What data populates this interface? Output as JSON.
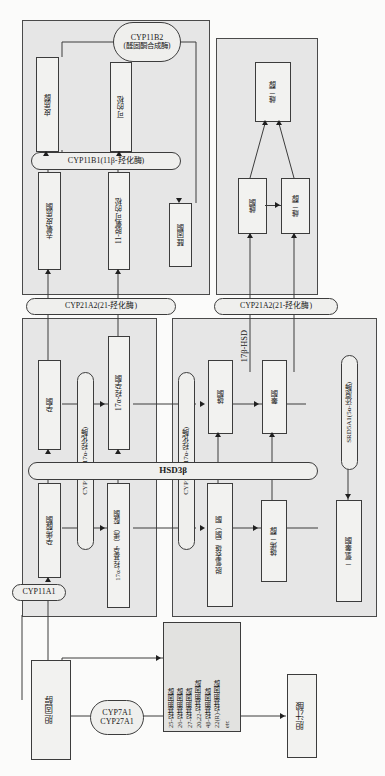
{
  "diagram": {
    "orientation": "rotated-90"
  },
  "groups": {
    "corticoid_panel": "corticoid-pathway-panel",
    "estrogen_panel": "estrogen-pathway-panel",
    "progestogen_panel": "progestogen-pathway-panel",
    "androgen_panel": "androgen-pathway-panel"
  },
  "metabolites": {
    "cortisol": "皮质醇",
    "cortisone": "可的松",
    "deoxycorticosterone": "去氧皮质酮",
    "deoxycortisol_11": "11-脱氧可的松",
    "aldosterone": "醛固酮",
    "estradiol": "雌二醇",
    "estrone": "雌酮",
    "estradiol_2": "雌二醇",
    "progesterone": "孕酮",
    "hydroxyprogesterone_17a": "17α-羟孕酮",
    "pregnenolone": "孕烯醇酮",
    "hydroxypregnenolone_17a": "17α-羟基孕（烯）醇酮",
    "androstenedione": "雄酮",
    "testosterone": "睾酮",
    "dhea": "脱氢表雄（酮）酮",
    "androstenediol": "雄烯二醇",
    "dihydrotestosterone": "二氢睾酮",
    "cholesterol": "胆固醇",
    "bile_acid": "胆汁酸"
  },
  "enzymes": {
    "cyp11b2": "CYP11B2\n(醛固酮合成酶)",
    "cyp11b2_line1": "CYP11B2",
    "cyp11b2_line2": "(醛固酮合成酶)",
    "cyp11b1": "CYP11B1(11β-羟化酶)",
    "cyp21a2_left": "CYP21A2(21-羟化酶)",
    "cyp21a2_right": "CYP21A2(21-羟化酶)",
    "cyp17a1_left": "CYP17A1(17α-羟化酶)",
    "cyp17a1_right": "CYP17A1(17α-羟化酶)",
    "hsd3b": "HSD3β",
    "hsd17b": "17β-HSD",
    "srd5a1": "SRD5A1(5α-还原酶)",
    "cyp11a1": "CYP11A1",
    "cyp7a1": "CYP7A1",
    "cyp27a1": "CYP27A1"
  },
  "oxysterols": {
    "lines": [
      "25-羟基胆固醇,",
      "26-羟基胆固醇,",
      "27-羟基胆固醇,",
      "20,22-羟基胆固醇,",
      "4β-羟基胆固醇,",
      "22(R)-羟基胆固醇,",
      "etc"
    ],
    "text": "25-羟基胆固醇,\n26-羟基胆固醇,\n27-羟基胆固醇,\n20,22-羟基胆固醇,\n4β-羟基胆固醇,\n22(R)-羟基胆固醇,\netc"
  },
  "colors": {
    "panel_fill": "#e6e6e6",
    "box_fill": "#f2f2f0",
    "stroke": "#3c3c3c",
    "page_bg": "#fbfbfa"
  }
}
